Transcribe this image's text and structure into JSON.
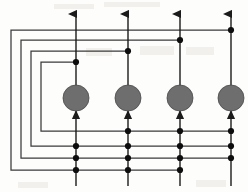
{
  "diagram": {
    "type": "signal-flow-graph",
    "canvas": {
      "width": 248,
      "height": 192,
      "background": "#fdfdfc"
    },
    "colors": {
      "trunk": "#1b1b1b",
      "loop": "#3a3a3a",
      "node_fill": "#6e6e6e",
      "node_stroke": "#4a4a4a",
      "junction": "#0d0d0d"
    },
    "trunks": [
      {
        "id": "trunk-1",
        "x": 76,
        "y_top": 12,
        "y_bottom": 186,
        "arrow_top": true,
        "label": "channel-1"
      },
      {
        "id": "trunk-2",
        "x": 128,
        "y_top": 12,
        "y_bottom": 186,
        "arrow_top": true,
        "label": "channel-2"
      },
      {
        "id": "trunk-3",
        "x": 180,
        "y_top": 12,
        "y_bottom": 186,
        "arrow_top": true,
        "label": "channel-3"
      },
      {
        "id": "trunk-4",
        "x": 231,
        "y_top": 12,
        "y_bottom": 186,
        "arrow_top": true,
        "label": "channel-4"
      }
    ],
    "nodes": [
      {
        "id": "node-1",
        "cx": 76,
        "cy": 98,
        "r": 13,
        "label": "gain-node-1"
      },
      {
        "id": "node-2",
        "cx": 128,
        "cy": 98,
        "r": 13,
        "label": "gain-node-2"
      },
      {
        "id": "node-3",
        "cx": 180,
        "cy": 98,
        "r": 13,
        "label": "gain-node-3"
      },
      {
        "id": "node-4",
        "cx": 231,
        "cy": 98,
        "r": 13,
        "label": "gain-node-4"
      }
    ],
    "node_input_arrows": [
      {
        "id": "in-arrow-1",
        "x": 76,
        "y": 112
      },
      {
        "id": "in-arrow-2",
        "x": 128,
        "y": 112
      },
      {
        "id": "in-arrow-3",
        "x": 180,
        "y": 112
      },
      {
        "id": "in-arrow-4",
        "x": 231,
        "y": 112
      }
    ],
    "loops": [
      {
        "id": "loop-outer",
        "order": 1,
        "tap_x": 231,
        "tap_y": 30,
        "left_x": 11,
        "return_y": 170,
        "return_x": 180,
        "path": "M231,30 L11,30 L11,170 L180,170"
      },
      {
        "id": "loop-second",
        "order": 2,
        "tap_x": 180,
        "tap_y": 40,
        "left_x": 21,
        "return_y": 158,
        "return_x": 231,
        "path": "M180,40 L21,40 L21,158 L231,158"
      },
      {
        "id": "loop-third",
        "order": 3,
        "tap_x": 128,
        "tap_y": 51,
        "left_x": 31,
        "return_y": 146,
        "return_x": 231,
        "path": "M128,51 L31,51 L31,146 L231,146"
      },
      {
        "id": "loop-inner",
        "order": 4,
        "tap_x": 76,
        "tap_y": 62,
        "left_x": 41,
        "return_y": 131,
        "return_x": 231,
        "path": "M76,62 L41,62 L41,131 L231,131"
      }
    ],
    "junction_dots": [
      {
        "id": "dot-tap-4",
        "x": 231,
        "y": 30
      },
      {
        "id": "dot-tap-3",
        "x": 180,
        "y": 40
      },
      {
        "id": "dot-tap-2",
        "x": 128,
        "y": 51
      },
      {
        "id": "dot-tap-1",
        "x": 76,
        "y": 62
      },
      {
        "id": "dot-r1-t2",
        "x": 128,
        "y": 131
      },
      {
        "id": "dot-r1-t3",
        "x": 180,
        "y": 131
      },
      {
        "id": "dot-r1-t4",
        "x": 231,
        "y": 131
      },
      {
        "id": "dot-r2-t1",
        "x": 76,
        "y": 146
      },
      {
        "id": "dot-r2-t2",
        "x": 128,
        "y": 146
      },
      {
        "id": "dot-r2-t3",
        "x": 180,
        "y": 146
      },
      {
        "id": "dot-r2-t4",
        "x": 231,
        "y": 146
      },
      {
        "id": "dot-r3-t1",
        "x": 76,
        "y": 158
      },
      {
        "id": "dot-r3-t2",
        "x": 128,
        "y": 158
      },
      {
        "id": "dot-r3-t3",
        "x": 180,
        "y": 158
      },
      {
        "id": "dot-r3-t4",
        "x": 231,
        "y": 158
      },
      {
        "id": "dot-r4-t1",
        "x": 76,
        "y": 170
      },
      {
        "id": "dot-r4-t2",
        "x": 128,
        "y": 170
      },
      {
        "id": "dot-r4-t3",
        "x": 180,
        "y": 170
      }
    ],
    "counts": {
      "trunks": 4,
      "nodes": 4,
      "loops": 4,
      "junctions": 18
    }
  }
}
